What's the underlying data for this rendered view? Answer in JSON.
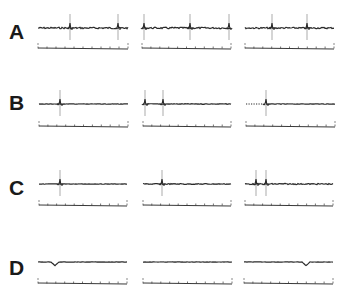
{
  "figure": {
    "panels": [
      {
        "label": "A",
        "description": "Repeated spikes across trace with small baseline oscillations",
        "label_y": 21,
        "trace_y": 28,
        "scale_y": 48,
        "columns": [
          {
            "x0": 38,
            "x1": 128,
            "spikes": [
              70,
              118
            ],
            "noise": 1.0,
            "end_marker": true
          },
          {
            "x0": 142,
            "x1": 231,
            "spikes": [
              144,
              190,
              229
            ],
            "noise": 1.0,
            "end_marker": true
          },
          {
            "x0": 245,
            "x1": 334,
            "spikes": [
              272,
              307
            ],
            "noise": 0.9,
            "end_marker": false
          }
        ]
      },
      {
        "label": "B",
        "description": "Single evoked spike followed by flat baseline",
        "label_y": 92,
        "trace_y": 104,
        "scale_y": 126,
        "columns": [
          {
            "x0": 39,
            "x1": 128,
            "spikes": [
              60
            ],
            "noise": 0.3,
            "end_marker": false
          },
          {
            "x0": 143,
            "x1": 231,
            "spikes": [
              145,
              163
            ],
            "noise": 0.4,
            "end_marker": false
          },
          {
            "x0": 246,
            "x1": 335,
            "spikes": [
              266
            ],
            "noise": 0.3,
            "dotted_start": true,
            "end_marker": false
          }
        ]
      },
      {
        "label": "C",
        "description": "Evoked spike with minor after-potential",
        "label_y": 177,
        "trace_y": 184,
        "scale_y": 205,
        "columns": [
          {
            "x0": 39,
            "x1": 127,
            "spikes": [
              60
            ],
            "noise": 0.3,
            "end_marker": false
          },
          {
            "x0": 143,
            "x1": 231,
            "spikes": [
              162
            ],
            "noise": 0.6,
            "end_marker": false
          },
          {
            "x0": 245,
            "x1": 333,
            "spikes": [
              256,
              266
            ],
            "noise": 0.7,
            "end_marker": false
          }
        ]
      },
      {
        "label": "D",
        "description": "Flat baseline, no spikes",
        "label_y": 257,
        "trace_y": 262,
        "scale_y": 283,
        "columns": [
          {
            "x0": 38,
            "x1": 127,
            "spikes": [],
            "noise": 0.2,
            "dip": 55,
            "end_marker": false
          },
          {
            "x0": 143,
            "x1": 232,
            "spikes": [],
            "noise": 0.1,
            "end_marker": false
          },
          {
            "x0": 244,
            "x1": 333,
            "spikes": [],
            "noise": 0.1,
            "dip": 306,
            "end_marker": false
          }
        ]
      }
    ],
    "colors": {
      "trace": "#2a2a2a",
      "scale": "#3a3a3a",
      "spike": "#444444",
      "label": "#1a1a1a"
    }
  }
}
